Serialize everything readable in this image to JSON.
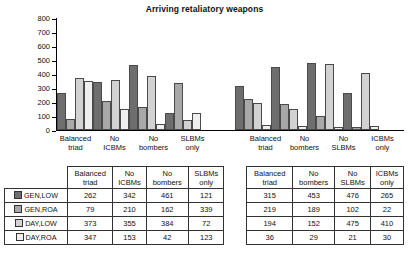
{
  "chart_data": {
    "type": "bar",
    "title": "Arriving retaliatory weapons",
    "xlabel": "",
    "ylabel": "",
    "ylim": [
      0,
      800
    ],
    "yticks": [
      0,
      100,
      200,
      300,
      400,
      500,
      600,
      700,
      800
    ],
    "grid": false,
    "legend_position": "table-row-headers",
    "series": [
      {
        "name": "GEN,LOW",
        "swatch": "#6e6e6e",
        "values": [
          262,
          342,
          461,
          121,
          315,
          453,
          476,
          265
        ]
      },
      {
        "name": "GEN,ROA",
        "swatch": "#a8a8a8",
        "values": [
          79,
          210,
          162,
          339,
          219,
          189,
          102,
          22
        ]
      },
      {
        "name": "DAY,LOW",
        "swatch": "#d2d2d2",
        "values": [
          373,
          355,
          384,
          72,
          194,
          152,
          475,
          410
        ]
      },
      {
        "name": "DAY,ROA",
        "swatch": "#efefef",
        "values": [
          347,
          153,
          42,
          123,
          36,
          29,
          21,
          30
        ]
      }
    ],
    "categories": [
      "Balanced\ntriad",
      "No\nICBMs",
      "No\nbombers",
      "SLBMs\nonly",
      "Balanced\ntriad",
      "No\nbombers",
      "No\nSLBMs",
      "ICBMs\nonly"
    ],
    "group_break_after_index": 3
  },
  "table": {
    "corner_label": "",
    "headers_left": [
      "Balanced\ntriad",
      "No\nICBMs",
      "No\nbombers",
      "SLBMs\nonly"
    ],
    "headers_right": [
      "Balanced\ntriad",
      "No\nbombers",
      "No\nSLBMs",
      "ICBMs\nonly"
    ],
    "rows": [
      {
        "label": "GEN,LOW",
        "left": [
          262,
          342,
          461,
          121
        ],
        "right": [
          315,
          453,
          476,
          265
        ]
      },
      {
        "label": "GEN,ROA",
        "left": [
          79,
          210,
          162,
          339
        ],
        "right": [
          219,
          189,
          102,
          22
        ]
      },
      {
        "label": "DAY,LOW",
        "left": [
          373,
          355,
          384,
          72
        ],
        "right": [
          194,
          152,
          475,
          410
        ]
      },
      {
        "label": "DAY,ROA",
        "left": [
          347,
          153,
          42,
          123
        ],
        "right": [
          36,
          29,
          21,
          30
        ]
      }
    ]
  }
}
